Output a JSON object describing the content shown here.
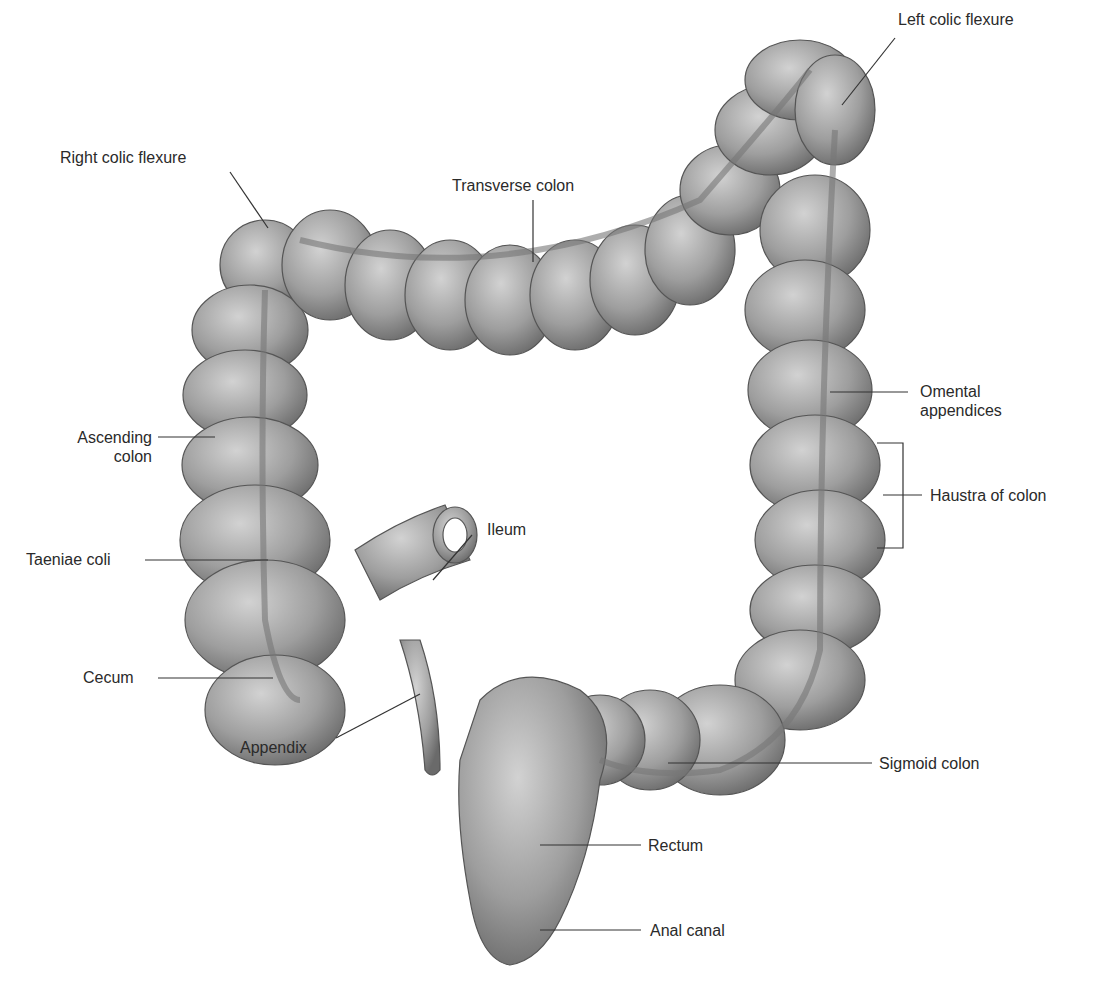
{
  "diagram": {
    "colors": {
      "tissue": "#9a9a9a",
      "tissue_light": "#c8c8c8",
      "tissue_dark": "#6e6e6e",
      "line": "#333333",
      "text": "#2a2a2a"
    },
    "labels": {
      "left_colic_flexure": "Left colic flexure",
      "right_colic_flexure": "Right colic flexure",
      "transverse_colon": "Transverse colon",
      "omental_appendices_1": "Omental",
      "omental_appendices_2": "appendices",
      "ascending_colon_1": "Ascending",
      "ascending_colon_2": "colon",
      "haustra_of_colon": "Haustra of colon",
      "ileum": "Ileum",
      "taeniae_coli": "Taeniae coli",
      "cecum": "Cecum",
      "appendix": "Appendix",
      "sigmoid_colon": "Sigmoid colon",
      "rectum": "Rectum",
      "anal_canal": "Anal canal"
    }
  }
}
